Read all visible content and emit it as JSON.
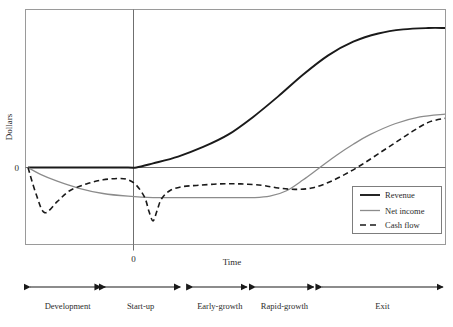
{
  "chart_data": {
    "type": "line",
    "title": "",
    "xlabel": "Time",
    "ylabel": "Dollars",
    "grid": false,
    "legend_position": "bottom-right",
    "x_tick_labels": [
      "0"
    ],
    "y_tick_labels": [
      "0"
    ],
    "x_zero_label": "0",
    "y_zero_label": "0",
    "xlim": [
      0,
      100
    ],
    "ylim": [
      -40,
      100
    ],
    "series": [
      {
        "name": "Revenue",
        "style": "solid",
        "color": "#1a1a1a",
        "width": 1.9,
        "points": [
          [
            0,
            0
          ],
          [
            8,
            0
          ],
          [
            16,
            0
          ],
          [
            24,
            0
          ],
          [
            26,
            0
          ],
          [
            30,
            3
          ],
          [
            36,
            8
          ],
          [
            42,
            15
          ],
          [
            48,
            24
          ],
          [
            54,
            37
          ],
          [
            60,
            52
          ],
          [
            66,
            68
          ],
          [
            72,
            82
          ],
          [
            78,
            92
          ],
          [
            84,
            98
          ],
          [
            90,
            101
          ],
          [
            96,
            102
          ],
          [
            100,
            102
          ]
        ]
      },
      {
        "name": "Net income",
        "style": "solid",
        "color": "#8c8c8c",
        "width": 1.3,
        "points": [
          [
            0,
            0
          ],
          [
            3,
            -5
          ],
          [
            7,
            -10
          ],
          [
            12,
            -15
          ],
          [
            18,
            -19
          ],
          [
            24,
            -21
          ],
          [
            30,
            -22
          ],
          [
            38,
            -22
          ],
          [
            46,
            -22
          ],
          [
            54,
            -22
          ],
          [
            58,
            -21
          ],
          [
            62,
            -17
          ],
          [
            66,
            -9
          ],
          [
            70,
            0
          ],
          [
            74,
            9
          ],
          [
            78,
            17
          ],
          [
            82,
            24
          ],
          [
            88,
            32
          ],
          [
            94,
            37
          ],
          [
            100,
            39
          ]
        ]
      },
      {
        "name": "Cash flow",
        "style": "dashed",
        "color": "#1a1a1a",
        "width": 1.6,
        "points": [
          [
            0,
            0
          ],
          [
            2,
            -20
          ],
          [
            4,
            -33
          ],
          [
            7,
            -25
          ],
          [
            10,
            -17
          ],
          [
            14,
            -12
          ],
          [
            18,
            -9
          ],
          [
            22,
            -8
          ],
          [
            24,
            -9
          ],
          [
            26,
            -13
          ],
          [
            28,
            -22
          ],
          [
            29,
            -32
          ],
          [
            30,
            -39
          ],
          [
            31,
            -31
          ],
          [
            32,
            -23
          ],
          [
            34,
            -17
          ],
          [
            37,
            -14
          ],
          [
            41,
            -13
          ],
          [
            46,
            -12
          ],
          [
            51,
            -12
          ],
          [
            56,
            -13
          ],
          [
            60,
            -15
          ],
          [
            64,
            -16
          ],
          [
            68,
            -15
          ],
          [
            72,
            -11
          ],
          [
            76,
            -5
          ],
          [
            80,
            2
          ],
          [
            84,
            10
          ],
          [
            88,
            18
          ],
          [
            92,
            26
          ],
          [
            96,
            33
          ],
          [
            100,
            36
          ]
        ]
      }
    ],
    "stages": [
      {
        "label": "Development",
        "x_start": 0,
        "x_end": 19
      },
      {
        "label": "Start-up",
        "x_start": 17,
        "x_end": 37
      },
      {
        "label": "Early-growth",
        "x_start": 39,
        "x_end": 53
      },
      {
        "label": "Rapid-growth",
        "x_start": 54,
        "x_end": 69
      },
      {
        "label": "Exit",
        "x_start": 70,
        "x_end": 100
      }
    ]
  },
  "legend": {
    "entries": [
      {
        "label": "Revenue"
      },
      {
        "label": "Net income"
      },
      {
        "label": "Cash flow"
      }
    ]
  }
}
